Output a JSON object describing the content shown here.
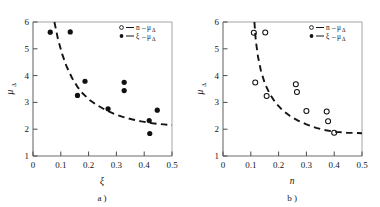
{
  "figure": {
    "background_color": "#fefefe",
    "ink_color": "#161616",
    "axis_color": "#6d6d6d",
    "panel_count": 2
  },
  "chart_data": [
    {
      "type": "scatter",
      "panel": "a",
      "caption": "a )",
      "title": "",
      "xlabel": "ξ",
      "ylabel": "μ",
      "ylabel_sub": "Δ",
      "xlim": [
        0,
        0.5
      ],
      "ylim": [
        1,
        6
      ],
      "xticks": [
        0,
        0.1,
        0.2,
        0.3,
        0.4,
        0.5
      ],
      "xtick_labels": [
        "0",
        "0.1",
        "0.2",
        "0.3",
        "0.4",
        "0.5"
      ],
      "yticks": [
        1,
        2,
        3,
        4,
        5,
        6
      ],
      "ytick_labels": [
        "1",
        "2",
        "3",
        "4",
        "5",
        "6"
      ],
      "grid": false,
      "marker": "filled-circle",
      "points": [
        {
          "x": 0.062,
          "y": 5.62
        },
        {
          "x": 0.134,
          "y": 5.63
        },
        {
          "x": 0.16,
          "y": 3.26
        },
        {
          "x": 0.187,
          "y": 3.79
        },
        {
          "x": 0.27,
          "y": 2.76
        },
        {
          "x": 0.328,
          "y": 3.75
        },
        {
          "x": 0.328,
          "y": 3.44
        },
        {
          "x": 0.418,
          "y": 2.32
        },
        {
          "x": 0.42,
          "y": 1.84
        },
        {
          "x": 0.447,
          "y": 2.71
        }
      ],
      "fit_curve": {
        "style": "dashed",
        "asymptote": 2.15,
        "points": [
          {
            "x": 0.077,
            "y": 6.0
          },
          {
            "x": 0.09,
            "y": 5.35
          },
          {
            "x": 0.105,
            "y": 4.8
          },
          {
            "x": 0.12,
            "y": 4.36
          },
          {
            "x": 0.14,
            "y": 3.92
          },
          {
            "x": 0.16,
            "y": 3.58
          },
          {
            "x": 0.18,
            "y": 3.32
          },
          {
            "x": 0.205,
            "y": 3.08
          },
          {
            "x": 0.23,
            "y": 2.9
          },
          {
            "x": 0.26,
            "y": 2.72
          },
          {
            "x": 0.29,
            "y": 2.58
          },
          {
            "x": 0.32,
            "y": 2.47
          },
          {
            "x": 0.355,
            "y": 2.37
          },
          {
            "x": 0.39,
            "y": 2.29
          },
          {
            "x": 0.43,
            "y": 2.22
          },
          {
            "x": 0.47,
            "y": 2.18
          },
          {
            "x": 0.5,
            "y": 2.15
          }
        ]
      },
      "legend": {
        "position": "top-right",
        "entries": [
          {
            "marker": "open-circle",
            "dash": "—",
            "var": "n",
            "minus": "–",
            "mu": "μ",
            "sub": "Δ"
          },
          {
            "marker": "filled-circle",
            "dash": "—",
            "var": "ξ",
            "minus": "–",
            "mu": "μ",
            "sub": "Δ"
          }
        ]
      }
    },
    {
      "type": "scatter",
      "panel": "b",
      "caption": "b )",
      "title": "",
      "xlabel": "n",
      "ylabel": "μ",
      "ylabel_sub": "Δ",
      "xlim": [
        0,
        0.5
      ],
      "ylim": [
        1,
        6
      ],
      "xticks": [
        0,
        0.1,
        0.2,
        0.3,
        0.4,
        0.5
      ],
      "xtick_labels": [
        "0",
        "0.1",
        "0.2",
        "0.3",
        "0.4",
        "0.5"
      ],
      "yticks": [
        1,
        2,
        3,
        4,
        5,
        6
      ],
      "ytick_labels": [
        "1",
        "2",
        "3",
        "4",
        "5",
        "6"
      ],
      "grid": false,
      "marker": "open-circle",
      "points": [
        {
          "x": 0.111,
          "y": 5.6
        },
        {
          "x": 0.152,
          "y": 5.61
        },
        {
          "x": 0.116,
          "y": 3.74
        },
        {
          "x": 0.157,
          "y": 3.24
        },
        {
          "x": 0.262,
          "y": 3.68
        },
        {
          "x": 0.266,
          "y": 3.39
        },
        {
          "x": 0.3,
          "y": 2.68
        },
        {
          "x": 0.373,
          "y": 2.66
        },
        {
          "x": 0.378,
          "y": 2.3
        },
        {
          "x": 0.4,
          "y": 1.87
        }
      ],
      "fit_curve": {
        "style": "dashed",
        "asymptote": 1.85,
        "points": [
          {
            "x": 0.113,
            "y": 6.0
          },
          {
            "x": 0.118,
            "y": 5.3
          },
          {
            "x": 0.126,
            "y": 4.7
          },
          {
            "x": 0.136,
            "y": 4.2
          },
          {
            "x": 0.15,
            "y": 3.72
          },
          {
            "x": 0.168,
            "y": 3.32
          },
          {
            "x": 0.188,
            "y": 3.0
          },
          {
            "x": 0.212,
            "y": 2.73
          },
          {
            "x": 0.24,
            "y": 2.5
          },
          {
            "x": 0.27,
            "y": 2.32
          },
          {
            "x": 0.3,
            "y": 2.18
          },
          {
            "x": 0.335,
            "y": 2.05
          },
          {
            "x": 0.37,
            "y": 1.96
          },
          {
            "x": 0.405,
            "y": 1.9
          },
          {
            "x": 0.445,
            "y": 1.87
          },
          {
            "x": 0.5,
            "y": 1.85
          }
        ]
      },
      "legend": {
        "position": "top-right",
        "entries": [
          {
            "marker": "open-circle",
            "dash": "—",
            "var": "n",
            "minus": "–",
            "mu": "μ",
            "sub": "Δ"
          },
          {
            "marker": "filled-circle",
            "dash": "—",
            "var": "ξ",
            "minus": "–",
            "mu": "μ",
            "sub": "Δ"
          }
        ]
      }
    }
  ]
}
